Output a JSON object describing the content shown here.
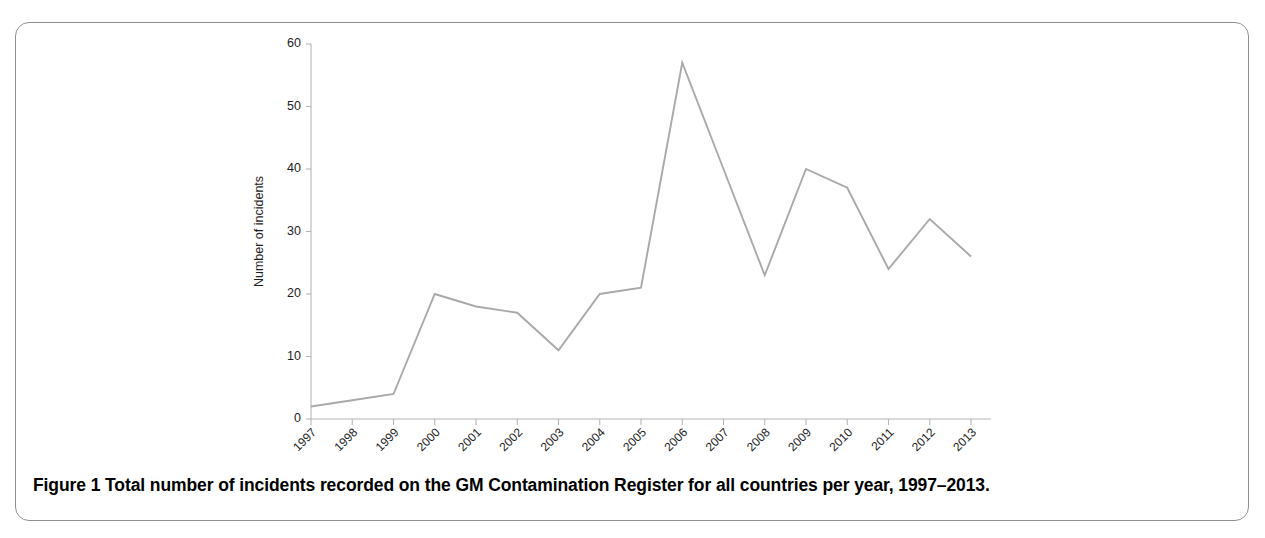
{
  "figure": {
    "caption_label": "Figure 1",
    "caption_text": "Total number of incidents recorded on the GM Contamination Register for all countries per year, 1997–2013."
  },
  "chart_data": {
    "type": "line",
    "title": "",
    "xlabel": "Year",
    "ylabel": "Number of incidents",
    "categories": [
      "1997",
      "1998",
      "1999",
      "2000",
      "2001",
      "2002",
      "2003",
      "2004",
      "2005",
      "2006",
      "2007",
      "2008",
      "2009",
      "2010",
      "2011",
      "2012",
      "2013"
    ],
    "values": [
      2,
      3,
      4,
      20,
      18,
      17,
      11,
      20,
      21,
      57,
      40,
      23,
      40,
      37,
      24,
      32,
      26
    ],
    "series": [
      {
        "name": "Total incidents",
        "values": [
          2,
          3,
          4,
          20,
          18,
          17,
          11,
          20,
          21,
          57,
          40,
          23,
          40,
          37,
          24,
          32,
          26
        ],
        "color": "#a9a9a9"
      }
    ],
    "ylim": [
      0,
      60
    ],
    "yticks": [
      0,
      10,
      20,
      30,
      40,
      50,
      60
    ],
    "ytick_labels": [
      "0",
      "10",
      "20",
      "30",
      "40",
      "50",
      "60"
    ],
    "xtick_labels": [
      "1997",
      "1998",
      "1999",
      "2000",
      "2001",
      "2002",
      "2003",
      "2004",
      "2005",
      "2006",
      "2007",
      "2008",
      "2009",
      "2010",
      "2011",
      "2012",
      "2013"
    ],
    "grid": false,
    "legend": "none",
    "xtick_rotation_deg": 45,
    "line_color": "#a9a9a9",
    "axis_color": "#b4b4b4"
  }
}
